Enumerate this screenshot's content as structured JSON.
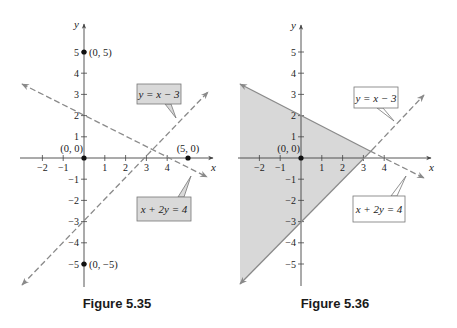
{
  "colors": {
    "axis": "#444444",
    "line": "#8a8a8a",
    "point": "#111111",
    "shade": "#d8d8d8",
    "callout_fill_filled": "#d9d9d9",
    "callout_fill_open": "#ffffff",
    "callout_stroke": "#777777",
    "text": "#222222"
  },
  "figures": [
    {
      "id": "fig-5-35",
      "caption": "Figure 5.35",
      "caption_x": 117,
      "origin": [
        84,
        158
      ],
      "unit": [
        20.8,
        21.2
      ],
      "axis_x": {
        "from": 20,
        "to": 213,
        "label": "x"
      },
      "axis_y": {
        "from": 287,
        "to": 24,
        "label": "y"
      },
      "x_ticks": [
        -2,
        -1,
        1,
        2,
        3,
        4
      ],
      "y_ticks": [
        -5,
        -4,
        -3,
        -2,
        -1,
        1,
        2,
        3,
        4,
        5
      ],
      "y_tick_labels_hidden": [],
      "points": [
        {
          "x": 0,
          "y": 0,
          "label": "(0, 0)",
          "label_pos": "above-left"
        },
        {
          "x": 0,
          "y": 5,
          "label": "(0, 5)",
          "label_pos": "right"
        },
        {
          "x": 5,
          "y": 0,
          "label": "(5, 0)",
          "label_pos": "above"
        },
        {
          "x": 0,
          "y": -5,
          "label": "(0, −5)",
          "label_pos": "right"
        }
      ],
      "shaded": false,
      "lines": [
        {
          "eq": "y = x − 3",
          "style": "dashed",
          "p1": [
            22,
            285
          ],
          "p2": [
            208,
            92
          ],
          "arrow_both": true
        },
        {
          "eq": "x + 2y = 4",
          "style": "dashed",
          "p1": [
            22,
            84
          ],
          "p2": [
            207,
            177
          ],
          "arrow_both": true
        }
      ],
      "callouts": [
        {
          "text": "y = x − 3",
          "box": [
            137,
            84,
            44,
            20
          ],
          "filled": true,
          "tip": [
            176,
            118
          ],
          "base": [
            168,
            104
          ]
        },
        {
          "text": "x + 2y = 4",
          "box": [
            137,
            197,
            54,
            24
          ],
          "filled": true,
          "tip": [
            191,
            176
          ],
          "base": [
            181,
            197
          ]
        }
      ]
    },
    {
      "id": "fig-5-36",
      "caption": "Figure 5.36",
      "caption_x": 335,
      "origin": [
        301,
        158
      ],
      "unit": [
        20.8,
        21.2
      ],
      "axis_x": {
        "from": 238,
        "to": 431,
        "label": "x"
      },
      "axis_y": {
        "from": 286,
        "to": 25,
        "label": "y"
      },
      "x_ticks": [
        -2,
        -1,
        1,
        2,
        3,
        4
      ],
      "y_ticks": [
        -5,
        -4,
        -3,
        -2,
        -1,
        1,
        2,
        3,
        4,
        5
      ],
      "points": [
        {
          "x": 0,
          "y": 0,
          "label": "(0, 0)",
          "label_pos": "above-left"
        }
      ],
      "shaded": true,
      "shade_polygon": [
        [
          240,
          84
        ],
        [
          370,
          151
        ],
        [
          240,
          284
        ]
      ],
      "lines": [
        {
          "eq": "x + 2y = 4",
          "style": "solid",
          "p1": [
            240,
            84
          ],
          "p2": [
            370,
            151
          ],
          "arrow_start": true
        },
        {
          "eq": "x + 2y = 4",
          "style": "dashed",
          "p1": [
            370,
            151
          ],
          "p2": [
            424,
            178
          ],
          "arrow_end": true
        },
        {
          "eq": "y = x − 3",
          "style": "solid",
          "p1": [
            240,
            284
          ],
          "p2": [
            372,
            150
          ],
          "arrow_start": true
        },
        {
          "eq": "y = x − 3",
          "style": "dashed",
          "p1": [
            372,
            150
          ],
          "p2": [
            424,
            95
          ],
          "arrow_end": true
        }
      ],
      "callouts": [
        {
          "text": "y = x − 3",
          "box": [
            354,
            87,
            44,
            21
          ],
          "filled": false,
          "tip": [
            394,
            121
          ],
          "base": [
            380,
            108
          ]
        },
        {
          "text": "x + 2y = 4",
          "box": [
            353,
            196,
            52,
            26
          ],
          "filled": false,
          "tip": [
            406,
            176
          ],
          "base": [
            394,
            196
          ]
        }
      ]
    }
  ],
  "chart_data": [
    {
      "type": "line",
      "title": "Figure 5.35",
      "xlabel": "x",
      "ylabel": "y",
      "xlim": [
        -3,
        6
      ],
      "ylim": [
        -6,
        6
      ],
      "x_tick_labels": [
        "−2",
        "−1",
        "1",
        "2",
        "3",
        "4"
      ],
      "y_tick_labels": [
        "−5",
        "−4",
        "−3",
        "−2",
        "−1",
        "1",
        "2",
        "3",
        "4",
        "5"
      ],
      "grid": false,
      "series": [
        {
          "name": "y = x − 3",
          "style": "dashed",
          "x": [
            -3,
            6
          ],
          "y": [
            -6,
            3
          ]
        },
        {
          "name": "x + 2y = 4",
          "style": "dashed",
          "x": [
            -3,
            6
          ],
          "y": [
            3.5,
            -1
          ]
        }
      ],
      "points": [
        {
          "label": "(0, 0)",
          "x": 0,
          "y": 0
        },
        {
          "label": "(0, 5)",
          "x": 0,
          "y": 5
        },
        {
          "label": "(5, 0)",
          "x": 5,
          "y": 0
        },
        {
          "label": "(0, −5)",
          "x": 0,
          "y": -5
        }
      ],
      "annotations": [
        "y = x − 3",
        "x + 2y = 4"
      ]
    },
    {
      "type": "area",
      "title": "Figure 5.36",
      "xlabel": "x",
      "ylabel": "y",
      "xlim": [
        -3,
        6
      ],
      "ylim": [
        -6,
        6
      ],
      "x_tick_labels": [
        "−2",
        "−1",
        "1",
        "2",
        "3",
        "4"
      ],
      "y_tick_labels": [
        "−5",
        "−4",
        "−3",
        "−2",
        "−1",
        "1",
        "2",
        "3",
        "4",
        "5"
      ],
      "grid": false,
      "series": [
        {
          "name": "y = x − 3",
          "style": "solid boundary, dashed beyond region",
          "x": [
            -3,
            6
          ],
          "y": [
            -6,
            3
          ]
        },
        {
          "name": "x + 2y = 4",
          "style": "solid boundary, dashed beyond region",
          "x": [
            -3,
            6
          ],
          "y": [
            3.5,
            -1
          ]
        }
      ],
      "shaded_region": {
        "description": "x + 2y < 4 and y > x − 3",
        "vertices": [
          [
            -3,
            3.5
          ],
          [
            3.33,
            0.33
          ],
          [
            -3,
            -6
          ]
        ]
      },
      "points": [
        {
          "label": "(0, 0)",
          "x": 0,
          "y": 0
        }
      ],
      "annotations": [
        "y = x − 3",
        "x + 2y = 4"
      ]
    }
  ]
}
